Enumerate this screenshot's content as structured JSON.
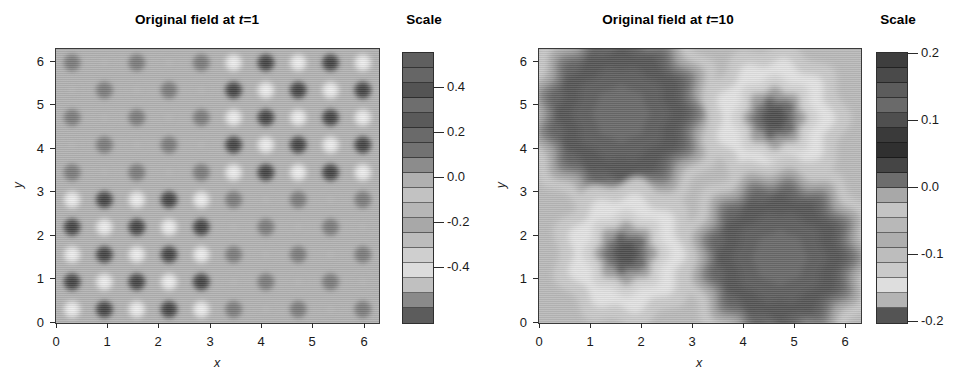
{
  "figure": {
    "panels": [
      {
        "id": "left",
        "title_prefix": "Original field at ",
        "title_var": "t",
        "title_suffix": "=1",
        "title_full": "Original field at t=1",
        "xlabel": "x",
        "ylabel": "y",
        "xticks": [
          "0",
          "1",
          "2",
          "3",
          "4",
          "5",
          "6"
        ],
        "yticks": [
          "0",
          "1",
          "2",
          "3",
          "4",
          "5",
          "6"
        ],
        "scale_title": "Scale",
        "cb_labels": [
          "0.4",
          "0.2",
          "0.0",
          "-0.2",
          "-0.4"
        ]
      },
      {
        "id": "right",
        "title_prefix": "Original field at ",
        "title_var": "t",
        "title_suffix": "=10",
        "title_full": "Original field at t=10",
        "xlabel": "x",
        "ylabel": "y",
        "xticks": [
          "0",
          "1",
          "2",
          "3",
          "4",
          "5",
          "6"
        ],
        "yticks": [
          "0",
          "1",
          "2",
          "3",
          "4",
          "5",
          "6"
        ],
        "scale_title": "Scale",
        "cb_labels": [
          "0.2",
          "0.1",
          "0.0",
          "-0.1",
          "-0.2"
        ]
      }
    ]
  },
  "chart_data": [
    {
      "id": "left-panel",
      "type": "heatmap",
      "title": "Original field at t=1",
      "xlabel": "x",
      "ylabel": "y",
      "xlim": [
        0,
        6.2832
      ],
      "ylim": [
        0,
        6.2832
      ],
      "xticks": [
        0,
        1,
        2,
        3,
        4,
        5,
        6
      ],
      "yticks": [
        0,
        1,
        2,
        3,
        4,
        5,
        6
      ],
      "grid": false,
      "colormap": "grayscale-discrete",
      "colorbar": {
        "title": "Scale",
        "ticks": [
          0.4,
          0.2,
          0.0,
          -0.2,
          -0.4
        ],
        "vmin": -0.55,
        "vmax": 0.55,
        "n_bands": 18,
        "band_colors": [
          "#5f5f5f",
          "#666666",
          "#545454",
          "#6e6e6e",
          "#5a5a5a",
          "#6a6a6a",
          "#727272",
          "#8c8c8c",
          "#b0b0b0",
          "#c2c2c2",
          "#b6b6b6",
          "#a8a8a8",
          "#bcbcbc",
          "#cfcfcf",
          "#dcdcdc",
          "#c0c0c0",
          "#8a8a8a",
          "#5c5c5c"
        ]
      },
      "description": "Fine checkerboard lattice of alternating light and dark blobs covering the full 0-2pi square; amplitude is largest in the upper-right quadrant (x>3.1, y>3.1) and the lower-left quadrant (x<3.1, y<3.1), which show strong dark/light contrast, while the upper-left and lower-right quadrants are low-amplitude and nearly uniform mid-grey.",
      "lattice": {
        "cells_x": 10,
        "cells_y": 10,
        "period_x": 0.628,
        "period_y": 0.628
      },
      "quadrants": [
        {
          "name": "upper-left",
          "x_range": [
            0,
            3.14
          ],
          "y_range": [
            3.14,
            6.28
          ],
          "amplitude": 0.18
        },
        {
          "name": "upper-right",
          "x_range": [
            3.14,
            6.28
          ],
          "y_range": [
            3.14,
            6.28
          ],
          "amplitude": 0.5
        },
        {
          "name": "lower-left",
          "x_range": [
            0,
            3.14
          ],
          "y_range": [
            0,
            3.14
          ],
          "amplitude": 0.5
        },
        {
          "name": "lower-right",
          "x_range": [
            3.14,
            6.28
          ],
          "y_range": [
            0,
            3.14
          ],
          "amplitude": 0.18
        }
      ]
    },
    {
      "id": "right-panel",
      "type": "heatmap",
      "title": "Original field at t=10",
      "xlabel": "x",
      "ylabel": "y",
      "xlim": [
        0,
        6.2832
      ],
      "ylim": [
        0,
        6.2832
      ],
      "xticks": [
        0,
        1,
        2,
        3,
        4,
        5,
        6
      ],
      "yticks": [
        0,
        1,
        2,
        3,
        4,
        5,
        6
      ],
      "grid": false,
      "colormap": "grayscale-discrete",
      "colorbar": {
        "title": "Scale",
        "ticks": [
          0.2,
          0.1,
          0.0,
          -0.1,
          -0.2
        ],
        "vmin": -0.2,
        "vmax": 0.2,
        "n_bands": 18,
        "band_colors": [
          "#3e3e3e",
          "#4a4a4a",
          "#5c5c5c",
          "#6a6a6a",
          "#4f4f4f",
          "#3a3a3a",
          "#303030",
          "#454545",
          "#6d6d6d",
          "#a8a8a8",
          "#c4c4c4",
          "#b8b8b8",
          "#aeaeae",
          "#bdbdbd",
          "#cacaca",
          "#dedede",
          "#b4b4b4",
          "#545454"
        ]
      },
      "description": "Four large coherent round blobs, one per quadrant, on a mid-grey background. Large dark (high-value) blob centred near (1.6, 4.8) in the upper-left; small dark core with bright white halo centred near (4.6, 4.7) in the upper-right; small dark core with bright white halo centred near (1.7, 1.6) in the lower-left; large dark blob centred near (4.7, 1.5) in the lower-right. Blob edges are scalloped/wavy from the discrete contour levels.",
      "blobs": [
        {
          "name": "upper-left-large-dark",
          "center": [
            1.6,
            4.8
          ],
          "radius": 1.55,
          "peak_value": 0.2,
          "halo": false
        },
        {
          "name": "upper-right-small-core",
          "center": [
            4.6,
            4.7
          ],
          "radius": 0.55,
          "peak_value": 0.17,
          "halo": true
        },
        {
          "name": "lower-left-small-core",
          "center": [
            1.7,
            1.6
          ],
          "radius": 0.55,
          "peak_value": 0.17,
          "halo": true
        },
        {
          "name": "lower-right-large-dark",
          "center": [
            4.7,
            1.5
          ],
          "radius": 1.5,
          "peak_value": 0.2,
          "halo": false
        }
      ]
    }
  ]
}
